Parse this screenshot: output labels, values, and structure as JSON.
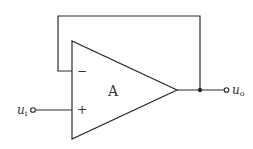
{
  "diagram": {
    "type": "op-amp voltage follower",
    "amplifier_label": "A",
    "inverting_sign": "−",
    "noninverting_sign": "+",
    "input_label": {
      "main": "u",
      "sub": "i"
    },
    "output_label": {
      "main": "u",
      "sub": "o"
    },
    "colors": {
      "line": "#2a2a2a",
      "text": "#333333",
      "background": "#ffffff"
    }
  }
}
